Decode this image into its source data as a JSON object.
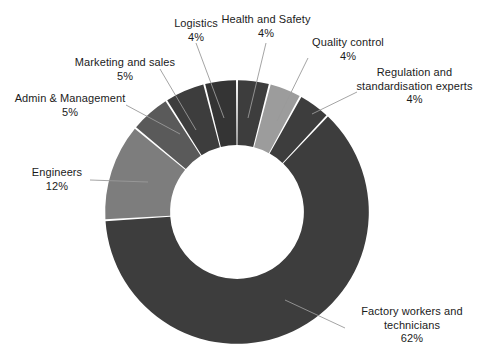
{
  "chart_data": {
    "type": "pie",
    "variant": "donut",
    "title": "",
    "subtitle": "",
    "xlabel": "",
    "ylabel": "",
    "grid": false,
    "legend_position": "none",
    "label_format": "name + percent",
    "start_angle_deg": 0,
    "direction": "clockwise",
    "inner_radius_ratio": 0.49,
    "categories": [
      "Health and Safety",
      "Quality control",
      "Regulation and standardisation experts",
      "Factory workers and technicians",
      "Engineers",
      "Admin & Management",
      "Marketing and sales",
      "Logistics"
    ],
    "values": [
      4,
      4,
      4,
      62,
      12,
      5,
      5,
      4
    ],
    "value_labels": [
      "4%",
      "4%",
      "4%",
      "62%",
      "12%",
      "5%",
      "5%",
      "4%"
    ],
    "colors": [
      "#3d3d3d",
      "#9c9c9c",
      "#3d3d3d",
      "#3d3d3d",
      "#7d7d7d",
      "#5a5a5a",
      "#3d3d3d",
      "#343434"
    ],
    "slice_gap_color": "#ffffff",
    "background": "#ffffff",
    "total": 100,
    "units": "percent"
  },
  "labels": {
    "logistics": {
      "name": "Logistics",
      "percent": "4%"
    },
    "health_and_safety": {
      "name": "Health and Safety",
      "percent": "4%"
    },
    "quality_control": {
      "name": "Quality control",
      "percent": "4%"
    },
    "regulation": {
      "name_line1": "Regulation and",
      "name_line2": "standardisation experts",
      "percent": "4%"
    },
    "marketing_and_sales": {
      "name": "Marketing and sales",
      "percent": "5%"
    },
    "admin_and_management": {
      "name": "Admin & Management",
      "percent": "5%"
    },
    "engineers": {
      "name": "Engineers",
      "percent": "12%"
    },
    "factory_workers": {
      "name_line1": "Factory workers and",
      "name_line2": "technicians",
      "percent": "62%"
    }
  }
}
